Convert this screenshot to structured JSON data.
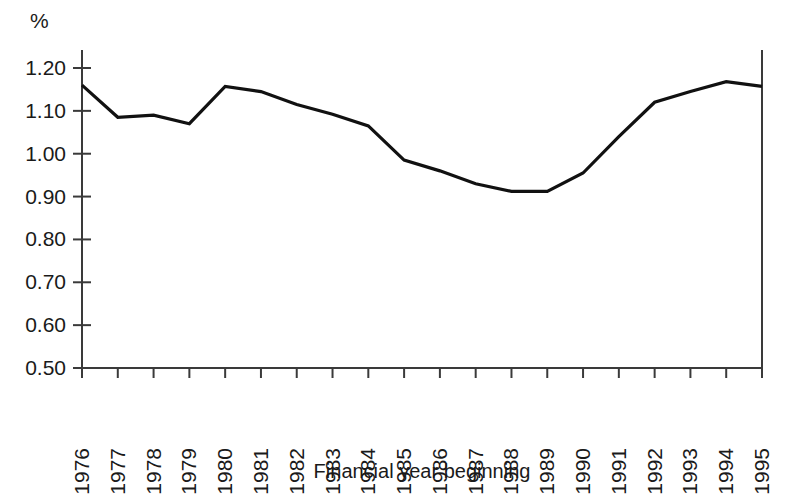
{
  "chart_data": {
    "type": "line",
    "title": "",
    "subtitle": "",
    "xlabel": "Financial year beginning",
    "ylabel": "%",
    "unit_label": "%",
    "categories": [
      "1976",
      "1977",
      "1978",
      "1979",
      "1980",
      "1981",
      "1982",
      "1983",
      "1984",
      "1985",
      "1986",
      "1987",
      "1988",
      "1989",
      "1990",
      "1991",
      "1992",
      "1993",
      "1994",
      "1995"
    ],
    "values": [
      1.16,
      1.085,
      1.09,
      1.07,
      1.157,
      1.145,
      1.115,
      1.092,
      1.065,
      0.985,
      0.96,
      0.93,
      0.912,
      0.912,
      0.955,
      1.04,
      1.12,
      1.145,
      1.168,
      1.157
    ],
    "series": [
      {
        "name": "percentage",
        "values": [
          1.16,
          1.085,
          1.09,
          1.07,
          1.157,
          1.145,
          1.115,
          1.092,
          1.065,
          0.985,
          0.96,
          0.93,
          0.912,
          0.912,
          0.955,
          1.04,
          1.12,
          1.145,
          1.168,
          1.157
        ],
        "color": "#111111"
      }
    ],
    "x": [
      "1976",
      "1977",
      "1978",
      "1979",
      "1980",
      "1981",
      "1982",
      "1983",
      "1984",
      "1985",
      "1986",
      "1987",
      "1988",
      "1989",
      "1990",
      "1991",
      "1992",
      "1993",
      "1994",
      "1995"
    ],
    "ylim": [
      0.5,
      1.2
    ],
    "ytick_values": [
      0.5,
      0.6,
      0.7,
      0.8,
      0.9,
      1.0,
      1.1,
      1.2
    ],
    "ytick_labels": [
      "0.50",
      "0.60",
      "0.70",
      "0.80",
      "0.90",
      "1.00",
      "1.10",
      "1.20"
    ],
    "xtick_labels": [
      "1976",
      "1977",
      "1978",
      "1979",
      "1980",
      "1981",
      "1982",
      "1983",
      "1984",
      "1985",
      "1986",
      "1987",
      "1988",
      "1989",
      "1990",
      "1991",
      "1992",
      "1993",
      "1994",
      "1995"
    ],
    "grid": false,
    "legend": false,
    "legend_position": "none",
    "xtick_label_rotation": -90,
    "annotations": []
  },
  "axis_title": {
    "x": "Financial year beginning"
  }
}
